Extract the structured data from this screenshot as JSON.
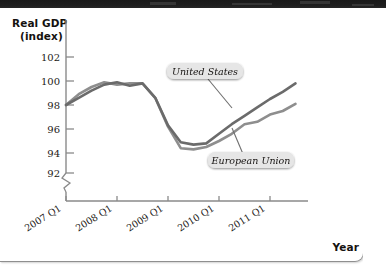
{
  "figure": {
    "name": "real-gdp-index-line-chart",
    "year_axis_label": "Year",
    "y_axis_title_line1": "Real GDP",
    "y_axis_title_line2": "(index)"
  },
  "colors": {
    "united_states_line": "#6b6b6b",
    "european_union_line": "#8e8e8e",
    "axis": "#8a8a8a",
    "text": "#1c1917",
    "label_chip_bg": "#e6e6e6",
    "page_background": "#ffffff",
    "scan_band": "#1c1c1c"
  },
  "chart_data": {
    "type": "line",
    "title": "",
    "subtitle": "",
    "xlabel": "Year",
    "ylabel": "Real GDP (index)",
    "ylim": [
      92,
      102
    ],
    "yticks": [
      92,
      94,
      96,
      98,
      100,
      102
    ],
    "ytick_labels": [
      "92",
      "94",
      "96",
      "98",
      "100",
      "102"
    ],
    "y_axis_break": true,
    "y_axis_break_note": "zigzag break between 92 and the x-axis",
    "grid": false,
    "legend_position": "inline-annotations",
    "xticks": [
      0,
      4,
      8,
      12,
      16
    ],
    "xtick_labels": [
      "2007 Q1",
      "2008 Q1",
      "2009 Q1",
      "2010 Q1",
      "2011 Q1"
    ],
    "x_quarters": [
      "2007 Q1",
      "2007 Q2",
      "2007 Q3",
      "2007 Q4",
      "2008 Q1",
      "2008 Q2",
      "2008 Q3",
      "2008 Q4",
      "2009 Q1",
      "2009 Q2",
      "2009 Q3",
      "2009 Q4",
      "2010 Q1",
      "2010 Q2",
      "2010 Q3",
      "2010 Q4",
      "2011 Q1",
      "2011 Q2",
      "2011 Q3"
    ],
    "series": [
      {
        "name": "United States",
        "color": "#6b6b6b",
        "values": [
          98.0,
          98.6,
          99.2,
          99.7,
          99.9,
          99.6,
          99.8,
          98.6,
          96.3,
          94.9,
          94.7,
          94.8,
          95.6,
          96.4,
          97.1,
          97.8,
          98.5,
          99.1,
          99.8
        ]
      },
      {
        "name": "European Union",
        "color": "#8e8e8e",
        "values": [
          98.0,
          98.9,
          99.5,
          99.9,
          99.7,
          99.8,
          99.8,
          98.6,
          96.2,
          94.4,
          94.3,
          94.5,
          95.0,
          95.6,
          96.4,
          96.6,
          97.2,
          97.5,
          98.1
        ]
      }
    ],
    "annotations": [
      {
        "text": "United States",
        "target_series": "United States",
        "style": "italic-chip-with-leader-line"
      },
      {
        "text": "European Union",
        "target_series": "European Union",
        "style": "italic-chip-with-leader-line"
      }
    ]
  }
}
